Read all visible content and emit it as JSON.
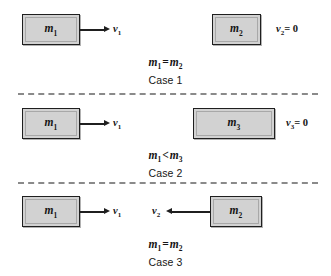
{
  "figure": {
    "background_color": "#ffffff",
    "block_fill_color": "#d2d2d2",
    "block_border_color": "#1f1f1f",
    "arrow_color": "#1f1f1f",
    "divider_color": "#8a8a8a"
  },
  "cases": [
    {
      "id": "case-1",
      "title": "Case 1",
      "relation": {
        "left": "m",
        "left_sub": "1",
        "operator": "=",
        "right": "m",
        "right_sub": "2"
      },
      "blocks": [
        {
          "name": "block-m1",
          "mass": "m",
          "mass_sub": "1"
        },
        {
          "name": "block-m2",
          "mass": "m",
          "mass_sub": "2"
        }
      ],
      "velocities": [
        {
          "name": "velocity-v1",
          "symbol": "v",
          "sub": "1",
          "value": "",
          "direction": "right"
        },
        {
          "name": "velocity-v2",
          "symbol": "v",
          "sub": "2",
          "value": "= 0",
          "direction": "none"
        }
      ]
    },
    {
      "id": "case-2",
      "title": "Case 2",
      "relation": {
        "left": "m",
        "left_sub": "1",
        "operator": "<",
        "right": "m",
        "right_sub": "3"
      },
      "blocks": [
        {
          "name": "block-m1",
          "mass": "m",
          "mass_sub": "1"
        },
        {
          "name": "block-m3",
          "mass": "m",
          "mass_sub": "3"
        }
      ],
      "velocities": [
        {
          "name": "velocity-v1",
          "symbol": "v",
          "sub": "1",
          "value": "",
          "direction": "right"
        },
        {
          "name": "velocity-v3",
          "symbol": "v",
          "sub": "3",
          "value": "= 0",
          "direction": "none"
        }
      ]
    },
    {
      "id": "case-3",
      "title": "Case 3",
      "relation": {
        "left": "m",
        "left_sub": "1",
        "operator": "=",
        "right": "m",
        "right_sub": "2"
      },
      "blocks": [
        {
          "name": "block-m1",
          "mass": "m",
          "mass_sub": "1"
        },
        {
          "name": "block-m2",
          "mass": "m",
          "mass_sub": "2"
        }
      ],
      "velocities": [
        {
          "name": "velocity-v1",
          "symbol": "v",
          "sub": "1",
          "value": "",
          "direction": "right"
        },
        {
          "name": "velocity-v2",
          "symbol": "v",
          "sub": "2",
          "value": "",
          "direction": "left"
        }
      ]
    }
  ],
  "labels": {
    "c1_m1": "m",
    "c1_m1_sub": "1",
    "c1_m2": "m",
    "c1_m2_sub": "2",
    "c1_v1": "v",
    "c1_v1_sub": "1",
    "c1_v2": "v",
    "c1_v2_sub": "2",
    "c1_v2_val": "= 0",
    "c1_rel_l": "m",
    "c1_rel_l_sub": "1",
    "c1_rel_op": "=",
    "c1_rel_r": "m",
    "c1_rel_r_sub": "2",
    "c1_title": "Case 1",
    "c2_m1": "m",
    "c2_m1_sub": "1",
    "c2_m3": "m",
    "c2_m3_sub": "3",
    "c2_v1": "v",
    "c2_v1_sub": "1",
    "c2_v3": "v",
    "c2_v3_sub": "3",
    "c2_v3_val": "= 0",
    "c2_rel_l": "m",
    "c2_rel_l_sub": "1",
    "c2_rel_op": "<",
    "c2_rel_r": "m",
    "c2_rel_r_sub": "3",
    "c2_title": "Case 2",
    "c3_m1": "m",
    "c3_m1_sub": "1",
    "c3_m2": "m",
    "c3_m2_sub": "2",
    "c3_v1": "v",
    "c3_v1_sub": "1",
    "c3_v2": "v",
    "c3_v2_sub": "2",
    "c3_rel_l": "m",
    "c3_rel_l_sub": "1",
    "c3_rel_op": "=",
    "c3_rel_r": "m",
    "c3_rel_r_sub": "2",
    "c3_title": "Case 3"
  }
}
